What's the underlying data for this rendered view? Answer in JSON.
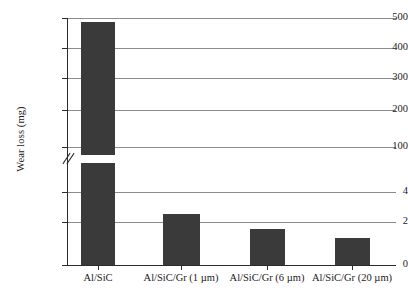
{
  "chart_data": {
    "type": "bar",
    "title": "",
    "xlabel": "",
    "ylabel": "Wear loss (mg)",
    "categories": [
      "Al/SiC",
      "Al/SiC/Gr (1 µm)",
      "Al/SiC/Gr (6 µm)",
      "Al/SiC/Gr (20 µm)"
    ],
    "values": [
      487,
      2.7,
      2.1,
      1.6
    ],
    "units": "mg",
    "broken_axis": true,
    "axis_break_marker": "//",
    "lower_segment": {
      "ylim": [
        0,
        5
      ],
      "ticks": [
        0,
        2,
        4
      ],
      "tick_labels": [
        "0",
        "2",
        "4"
      ]
    },
    "upper_segment": {
      "ylim": [
        90,
        520
      ],
      "ticks": [
        100,
        200,
        300,
        400,
        500
      ],
      "tick_labels": [
        "100",
        "200",
        "300",
        "400",
        "500"
      ]
    },
    "grid": true,
    "grid_axis": "y",
    "legend": null,
    "bar_color": "#3a3a3a",
    "grid_color": "#8c8c8c",
    "axis_color": "#2b2b2b"
  },
  "yticks": [
    {
      "label": "500",
      "top": 18
    },
    {
      "label": "400",
      "top": 48
    },
    {
      "label": "300",
      "top": 78
    },
    {
      "label": "200",
      "top": 110
    },
    {
      "label": "100",
      "top": 147
    },
    {
      "label": "4",
      "top": 192
    },
    {
      "label": "2",
      "top": 222
    },
    {
      "label": "0",
      "top": 265
    }
  ],
  "bars": [
    {
      "name": "Al/SiC",
      "left": 81,
      "width": 34,
      "top": 22,
      "height": 133,
      "segment": "upper"
    },
    {
      "name": "Al/SiC-lower",
      "left": 81,
      "width": 34,
      "top": 163,
      "height": 102,
      "segment": "lower"
    },
    {
      "name": "Al/SiC/Gr (1 µm)",
      "left": 163,
      "width": 37,
      "top": 214,
      "height": 51,
      "segment": "lower"
    },
    {
      "name": "Al/SiC/Gr (6 µm)",
      "left": 250,
      "width": 35,
      "top": 229,
      "height": 36,
      "segment": "lower"
    },
    {
      "name": "Al/SiC/Gr (20 µm)",
      "left": 335,
      "width": 35,
      "top": 238,
      "height": 27,
      "segment": "lower"
    }
  ],
  "xticks": [
    {
      "label": "Al/SiC",
      "tick_left": 98,
      "label_center": 98
    },
    {
      "label": "Al/SiC/Gr (1 µm)",
      "tick_left": 181,
      "label_center": 181
    },
    {
      "label": "Al/SiC/Gr (6 µm)",
      "tick_left": 267,
      "label_center": 267
    },
    {
      "label": "Al/SiC/Gr (20 µm)",
      "tick_left": 352,
      "label_center": 352
    }
  ],
  "gridlines": [
    18,
    48,
    78,
    110,
    147,
    192,
    222
  ]
}
